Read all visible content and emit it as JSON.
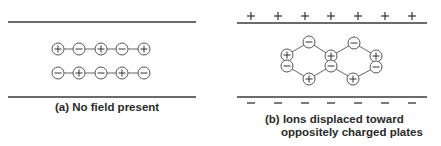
{
  "panel_a": {
    "caption": "(a) No field present",
    "row1": [
      "+",
      "-",
      "+",
      "-",
      "+"
    ],
    "row2": [
      "-",
      "+",
      "-",
      "+",
      "-"
    ]
  },
  "panel_b": {
    "caption_line1": "(b) Ions displaced toward",
    "caption_line2": "oppositely charged plates",
    "top_plate_charges": [
      "+",
      "+",
      "+",
      "+",
      "+",
      "+",
      "+"
    ],
    "bottom_plate_charges": [
      "-",
      "-",
      "-",
      "-",
      "-",
      "-",
      "-"
    ]
  },
  "colors": {
    "line": "#3a3a3a",
    "ion_stroke": "#555555",
    "text": "#2a2a2a"
  }
}
